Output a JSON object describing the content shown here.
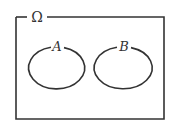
{
  "diagram": {
    "type": "venn",
    "universe": {
      "label": "Ω"
    },
    "sets": [
      {
        "label": "A"
      },
      {
        "label": "B"
      }
    ],
    "colors": {
      "stroke": "#333333",
      "background": "#ffffff"
    }
  }
}
